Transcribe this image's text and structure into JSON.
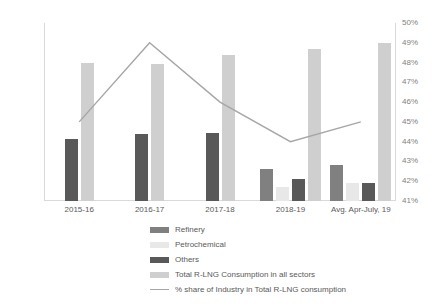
{
  "chart_data": {
    "type": "bar",
    "title": "",
    "subtitle": "",
    "xlabel": "",
    "ylabel": "",
    "categories": [
      "2015-16",
      "2016-17",
      "2017-18",
      "2018-19",
      "Avg. Apr-July, 19"
    ],
    "series": [
      {
        "name": "Refinery",
        "axis": "left",
        "color": "#808080",
        "values": [
          null,
          null,
          null,
          16,
          18
        ]
      },
      {
        "name": "Petrochemical",
        "axis": "left",
        "color": "#e8e8e8",
        "values": [
          null,
          null,
          null,
          7,
          9
        ]
      },
      {
        "name": "Others",
        "axis": "left",
        "color": "#595959",
        "values": [
          31.5,
          34,
          34.5,
          11,
          9
        ]
      },
      {
        "name": "Total R-LNG Consumption in all sectors",
        "axis": "left",
        "color": "#cfcfcf",
        "values": [
          70,
          69.5,
          74,
          77,
          80
        ]
      },
      {
        "name": "% share of Industry in Total R-LNG consumption",
        "type": "line",
        "axis": "right",
        "color": "#a6a6a6",
        "values": [
          45,
          49,
          46,
          44,
          45
        ]
      }
    ],
    "ylim": [
      0,
      90
    ],
    "yticks": [
      90,
      80,
      70,
      60,
      50,
      40,
      30,
      20,
      10,
      0
    ],
    "y2lim": [
      41,
      50
    ],
    "y2ticks": [
      "50%",
      "49%",
      "48%",
      "47%",
      "46%",
      "45%",
      "44%",
      "43%",
      "42%",
      "41%"
    ],
    "grid": false,
    "legend_position": "bottom"
  },
  "legend": {
    "items": [
      {
        "label": "Refinery",
        "color": "#808080",
        "marker": "swatch"
      },
      {
        "label": "Petrochemical",
        "color": "#e8e8e8",
        "marker": "swatch"
      },
      {
        "label": "Others",
        "color": "#595959",
        "marker": "swatch"
      },
      {
        "label": "Total R-LNG Consumption in all sectors",
        "color": "#cfcfcf",
        "marker": "swatch"
      },
      {
        "label": "% share of Industry in Total R-LNG consumption",
        "color": "#a6a6a6",
        "marker": "line"
      }
    ]
  },
  "axes": {
    "left_ticks": [
      "90",
      "80",
      "70",
      "60",
      "50",
      "40",
      "30",
      "20",
      "10",
      "0"
    ],
    "right_ticks": [
      "50%",
      "49%",
      "48%",
      "47%",
      "46%",
      "45%",
      "44%",
      "43%",
      "42%",
      "41%"
    ]
  }
}
